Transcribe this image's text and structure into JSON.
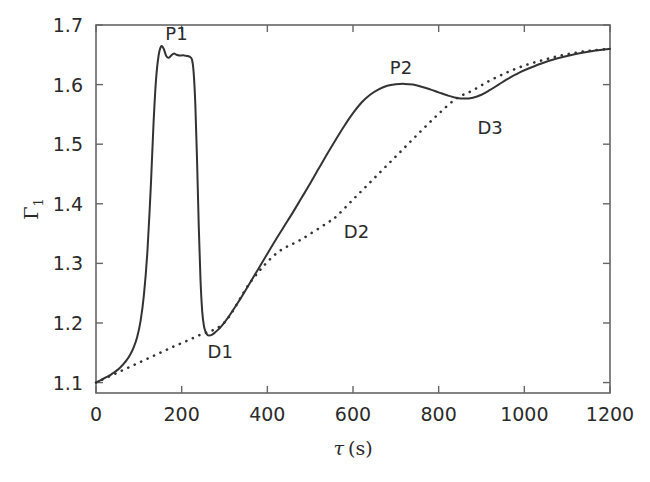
{
  "chart_data": {
    "type": "line",
    "title": "",
    "xlabel": "τ (s)",
    "ylabel": "Γ₁",
    "ylabel_base": "Γ",
    "ylabel_sub": "1",
    "xlabel_symbol": "τ",
    "xlabel_unit": "(s)",
    "xlim": [
      0,
      1200
    ],
    "ylim": [
      1.0825,
      1.7
    ],
    "xticks": [
      0,
      200,
      400,
      600,
      800,
      1000,
      1200
    ],
    "xtick_labels": [
      "0",
      "200",
      "400",
      "600",
      "800",
      "1000",
      "1200"
    ],
    "yticks": [
      1.1,
      1.2,
      1.3,
      1.4,
      1.5,
      1.6,
      1.7
    ],
    "ytick_labels": [
      "1.1",
      "1.2",
      "1.3",
      "1.4",
      "1.5",
      "1.6",
      "1.7"
    ],
    "grid": false,
    "legend": "none",
    "line_color": "#333333",
    "frame_color": "#666666",
    "series": [
      {
        "name": "measured",
        "style": "solid",
        "color": "#333333",
        "x": [
          0,
          8,
          16,
          24,
          32,
          40,
          48,
          56,
          64,
          72,
          80,
          88,
          96,
          104,
          112,
          120,
          128,
          134,
          140,
          146,
          152,
          158,
          164,
          170,
          176,
          182,
          188,
          194,
          200,
          206,
          212,
          218,
          224,
          228,
          232,
          236,
          240,
          244,
          248,
          252,
          256,
          260,
          264,
          270,
          276,
          284,
          292,
          300,
          312,
          324,
          340,
          360,
          380,
          400,
          420,
          440,
          460,
          480,
          500,
          520,
          540,
          560,
          580,
          600,
          620,
          640,
          660,
          680,
          700,
          720,
          740,
          760,
          780,
          800,
          820,
          840,
          860,
          880,
          900,
          920,
          940,
          960,
          980,
          1000,
          1040,
          1080,
          1120,
          1160,
          1200
        ],
        "y": [
          1.1,
          1.103,
          1.106,
          1.109,
          1.112,
          1.116,
          1.12,
          1.125,
          1.131,
          1.138,
          1.147,
          1.159,
          1.176,
          1.203,
          1.248,
          1.32,
          1.43,
          1.53,
          1.607,
          1.648,
          1.664,
          1.66,
          1.648,
          1.645,
          1.649,
          1.652,
          1.65,
          1.649,
          1.649,
          1.649,
          1.648,
          1.647,
          1.642,
          1.62,
          1.565,
          1.47,
          1.36,
          1.272,
          1.219,
          1.195,
          1.185,
          1.18,
          1.179,
          1.18,
          1.183,
          1.188,
          1.194,
          1.201,
          1.213,
          1.226,
          1.244,
          1.268,
          1.292,
          1.316,
          1.34,
          1.363,
          1.386,
          1.41,
          1.434,
          1.459,
          1.484,
          1.508,
          1.531,
          1.552,
          1.57,
          1.583,
          1.592,
          1.598,
          1.6005,
          1.6012,
          1.6,
          1.5965,
          1.592,
          1.587,
          1.582,
          1.578,
          1.5765,
          1.578,
          1.583,
          1.591,
          1.6,
          1.609,
          1.617,
          1.624,
          1.6355,
          1.6445,
          1.6515,
          1.6565,
          1.66
        ]
      },
      {
        "name": "baseline",
        "style": "dashed",
        "color": "#333333",
        "x": [
          0,
          60,
          120,
          180,
          240,
          300,
          360,
          420,
          480,
          540,
          560,
          600,
          640,
          680,
          720,
          760,
          800,
          840,
          880,
          920,
          960,
          1000,
          1040,
          1080,
          1120,
          1160,
          1200
        ],
        "y": [
          1.1,
          1.12,
          1.14,
          1.16,
          1.179,
          1.201,
          1.268,
          1.316,
          1.3405,
          1.368,
          1.378,
          1.407,
          1.436,
          1.465,
          1.494,
          1.523,
          1.551,
          1.576,
          1.5905,
          1.607,
          1.6205,
          1.632,
          1.6405,
          1.648,
          1.6535,
          1.6575,
          1.66
        ]
      }
    ],
    "annotations": [
      {
        "id": "P1",
        "label": "P1",
        "x": 188,
        "y": 1.685,
        "point_x": 152,
        "point_y": 1.664,
        "type": "peak"
      },
      {
        "id": "D1",
        "label": "D1",
        "x": 290,
        "y": 1.152,
        "point_x": 262,
        "point_y": 1.179,
        "type": "valley"
      },
      {
        "id": "D2",
        "label": "D2",
        "x": 608,
        "y": 1.352,
        "point_x": 555,
        "point_y": 1.378,
        "type": "departure"
      },
      {
        "id": "P2",
        "label": "P2",
        "x": 712,
        "y": 1.628,
        "point_x": 728,
        "point_y": 1.601,
        "type": "peak"
      },
      {
        "id": "D3",
        "label": "D3",
        "x": 920,
        "y": 1.527,
        "point_x": 838,
        "point_y": 1.5765,
        "type": "valley"
      }
    ]
  }
}
